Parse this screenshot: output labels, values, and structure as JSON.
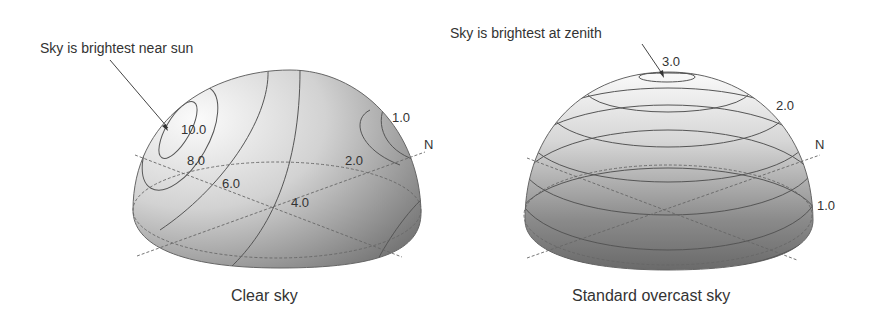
{
  "left_panel": {
    "annotation": "Sky is brightest near sun",
    "caption": "Clear sky",
    "contour_labels": [
      "10.0",
      "8.0",
      "6.0",
      "4.0",
      "2.0",
      "1.0"
    ],
    "compass": "N"
  },
  "right_panel": {
    "annotation": "Sky is brightest at zenith",
    "caption": "Standard overcast sky",
    "contour_labels": [
      "3.0",
      "2.0",
      "1.0"
    ],
    "compass": "N"
  }
}
